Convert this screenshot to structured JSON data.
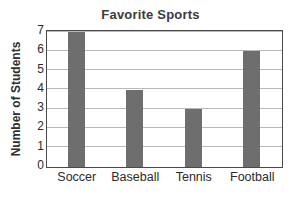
{
  "chart_data": {
    "type": "bar",
    "title": "Favorite Sports",
    "xlabel": "",
    "ylabel": "Number of Students",
    "categories": [
      "Soccer",
      "Baseball",
      "Tennis",
      "Football"
    ],
    "values": [
      7,
      4,
      3,
      6
    ],
    "ylim": [
      0,
      7
    ],
    "yticks": [
      0,
      1,
      2,
      3,
      4,
      5,
      6,
      7
    ],
    "ytick_labels": [
      "0",
      "1",
      "2",
      "3",
      "4",
      "5",
      "6",
      "7"
    ],
    "grid": true,
    "grid_axis": "y",
    "legend": false,
    "bar_color": "#6e6e6e",
    "gridline_color": "#b9b9b9",
    "axis_color": "#4a4a4a",
    "title_color": "#3b3b3b",
    "background_color": "#ffffff"
  }
}
